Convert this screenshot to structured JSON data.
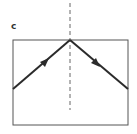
{
  "panel_label": "c",
  "diagram": {
    "type": "reflection",
    "normal_line": "dashed",
    "incident_ray_direction": "up-right",
    "reflected_ray_direction": "down-right",
    "colors": {
      "stroke": "#2b2b2b",
      "box": "#555555",
      "normal": "#666666"
    }
  }
}
